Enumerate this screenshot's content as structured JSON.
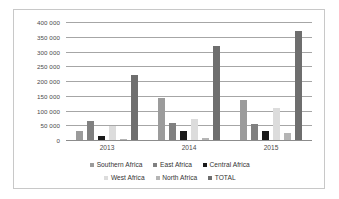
{
  "chart_data": {
    "type": "bar",
    "title": "",
    "subtitle": "",
    "xlabel": "",
    "ylabel": "",
    "categories": [
      "2013",
      "2014",
      "2015"
    ],
    "ylim": [
      0,
      400000
    ],
    "y_ticks": [
      0,
      50000,
      100000,
      150000,
      200000,
      250000,
      300000,
      350000,
      400000
    ],
    "y_tick_labels": [
      "0",
      "50 000",
      "100 000",
      "150 000",
      "200 000",
      "250 000",
      "300 000",
      "350 000",
      "400 000"
    ],
    "grid": true,
    "legend_position": "bottom",
    "series": [
      {
        "name": "Southern Africa",
        "color": "#9b9b9b",
        "values": [
          30000,
          142000,
          136000
        ]
      },
      {
        "name": "East Africa",
        "color": "#808080",
        "values": [
          65000,
          57000,
          54000
        ]
      },
      {
        "name": "Central Africa",
        "color": "#1a1a1a",
        "values": [
          14000,
          29000,
          31000
        ]
      },
      {
        "name": "West Africa",
        "color": "#dcdcdc",
        "values": [
          47000,
          70000,
          108000
        ]
      },
      {
        "name": "North Africa",
        "color": "#b5b5b5",
        "values": [
          5000,
          6000,
          23000
        ]
      },
      {
        "name": "TOTAL",
        "color": "#6e6e6e",
        "values": [
          220000,
          320000,
          370000
        ]
      }
    ]
  },
  "legend": {
    "rows": [
      [
        {
          "label": "Southern Africa",
          "swatch": "#9b9b9b"
        },
        {
          "label": "East Africa",
          "swatch": "#808080"
        },
        {
          "label": "Central Africa",
          "swatch": "#1a1a1a"
        }
      ],
      [
        {
          "label": "West Africa",
          "swatch": "#dcdcdc"
        },
        {
          "label": "North Africa",
          "swatch": "#b5b5b5"
        },
        {
          "label": "TOTAL",
          "swatch": "#6e6e6e"
        }
      ]
    ]
  }
}
